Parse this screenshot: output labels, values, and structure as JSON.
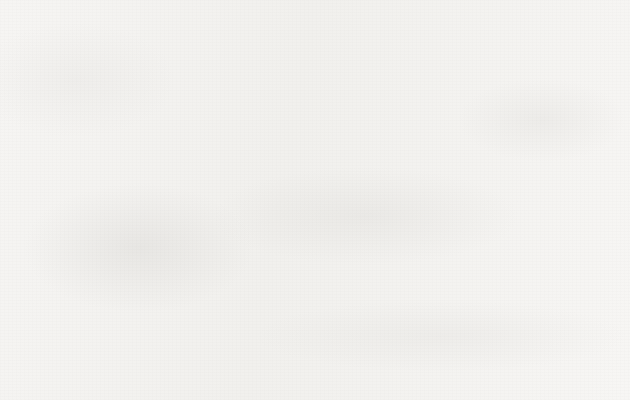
{
  "chart_data": {
    "type": "line",
    "title": "",
    "subtitle": "",
    "xlabel": "",
    "ylabel": "",
    "categories": [
      "2001",
      "2002",
      "2003",
      "2004",
      "2005",
      "2006",
      "2007",
      "2008"
    ],
    "series": [
      {
        "name": "废水排放量(亿吨)",
        "marker": "open-diamond",
        "values": [
          435,
          440,
          462,
          484,
          521,
          541,
          557,
          572
        ]
      }
    ],
    "ylim": [
      0,
      700
    ],
    "ytick_values": [
      0,
      100,
      200,
      300,
      400,
      500,
      600,
      700
    ],
    "ytick_labels": [
      "0",
      "100",
      "200",
      "300",
      "400",
      "500",
      "600",
      "700"
    ],
    "ytick_step": 100,
    "xtick_labels": [
      "2001",
      "2002",
      "2003",
      "2004",
      "2005",
      "2006",
      "2007",
      "2008"
    ],
    "grid": false,
    "legend_position": "bottom-center",
    "legend_entries": [
      "废水排放量(亿吨)"
    ],
    "annotations": [],
    "colors": {
      "line": "#1a1a1a",
      "marker_fill": "#f7f6f4",
      "marker_stroke": "#151515",
      "axis": "#1c1c1c",
      "text": "#1a1a1a",
      "background": "#f6f5f3"
    }
  },
  "legend": {
    "label": "废水排放量(亿吨)",
    "marker_name": "open-diamond-marker"
  }
}
